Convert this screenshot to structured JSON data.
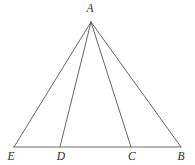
{
  "figure": {
    "type": "geometry-diagram",
    "canvas": {
      "width": 195,
      "height": 165,
      "background": "#ffffff"
    },
    "style": {
      "stroke_color": "#555555",
      "baseline_stroke_color": "#6e6e6e",
      "stroke_width": 0.9,
      "label_color": "#2b2b2b",
      "label_font_size": 11.5
    },
    "points": [
      {
        "id": "A",
        "label": "A",
        "x": 91,
        "y": 22,
        "label_x": 90,
        "label_y": 9,
        "role": "apex"
      },
      {
        "id": "E",
        "label": "E",
        "x": 14,
        "y": 147,
        "label_x": 11,
        "label_y": 157,
        "role": "base-left-endpoint"
      },
      {
        "id": "D",
        "label": "D",
        "x": 60,
        "y": 147,
        "label_x": 61,
        "label_y": 157,
        "role": "base-point"
      },
      {
        "id": "C",
        "label": "C",
        "x": 131,
        "y": 147,
        "label_x": 132,
        "label_y": 157,
        "role": "base-point"
      },
      {
        "id": "B",
        "label": "B",
        "x": 181,
        "y": 147,
        "label_x": 181,
        "label_y": 157,
        "role": "base-right-endpoint"
      }
    ],
    "segments": [
      {
        "id": "AE",
        "from": "A",
        "to": "E",
        "name": "side-a-e"
      },
      {
        "id": "AD",
        "from": "A",
        "to": "D",
        "name": "cevian-a-d"
      },
      {
        "id": "AC",
        "from": "A",
        "to": "C",
        "name": "cevian-a-c"
      },
      {
        "id": "AB",
        "from": "A",
        "to": "B",
        "name": "side-a-b"
      },
      {
        "id": "EB",
        "from": "E",
        "to": "B",
        "name": "baseline-e-b"
      }
    ]
  },
  "chart_data": {
    "type": "diagram",
    "title": "",
    "labels": [
      "A",
      "E",
      "D",
      "C",
      "B"
    ],
    "x": [
      91,
      14,
      60,
      131,
      181
    ],
    "y": [
      22,
      147,
      147,
      147,
      147
    ],
    "edges": [
      [
        "A",
        "E"
      ],
      [
        "A",
        "D"
      ],
      [
        "A",
        "C"
      ],
      [
        "A",
        "B"
      ],
      [
        "E",
        "B"
      ]
    ]
  }
}
